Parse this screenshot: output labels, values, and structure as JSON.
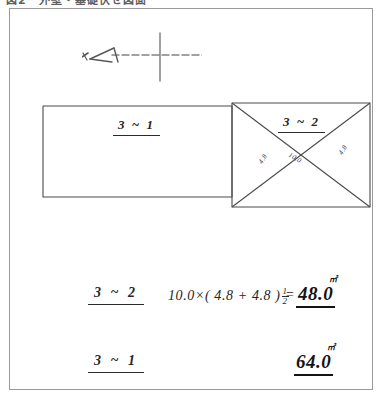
{
  "document": {
    "header_text": "図2　外壁・基礎伏せ図面",
    "sheet_kind": "handwritten-area-calculation-worksheet"
  },
  "north_mark": {
    "name": "north-direction-arrow",
    "stroke_color": "#555555"
  },
  "plan": {
    "rooms": [
      {
        "id": "room-3-1",
        "label": "3 ~ 1",
        "shape": "rectangle",
        "has_diagonals": false
      },
      {
        "id": "room-3-2",
        "label": "3 ~ 2",
        "shape": "rectangle",
        "has_diagonals": true
      }
    ],
    "dimensions": [
      {
        "id": "dim-left",
        "text": "4.8"
      },
      {
        "id": "dim-center",
        "text": "10.0"
      },
      {
        "id": "dim-right",
        "text": "4.8"
      }
    ],
    "line_color": "#4a4a4a"
  },
  "calculations": [
    {
      "id": "calc-3-2",
      "label": "3 ~ 2",
      "expression_prefix": "10.0",
      "operator": "×",
      "paren": "( 4.8 + 4.8 )",
      "fraction": {
        "numerator": "1",
        "denominator": "2"
      },
      "equals": "=",
      "result": "48.0",
      "result_superscript": "㎡"
    },
    {
      "id": "calc-3-1",
      "label": "3 ~ 1",
      "expression_prefix": "",
      "operator": "",
      "paren": "",
      "fraction": null,
      "equals": "",
      "result": "64.0",
      "result_superscript": "㎡"
    }
  ],
  "colors": {
    "frame_border": "#9a9a9a",
    "ink": "#262626",
    "ink_bold": "#141414",
    "paper": "#ffffff"
  }
}
